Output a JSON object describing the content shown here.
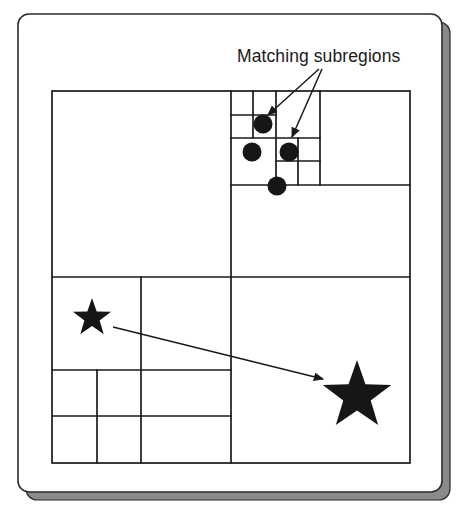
{
  "figure": {
    "title_annotation": "Matching subregions",
    "colors": {
      "background": "#ffffff",
      "line": "#1a1a1a",
      "shape_fill": "#161616",
      "frame_shadow": "#8a8a8a",
      "frame_border": "#2b2b2b",
      "text": "#1a1a1a"
    },
    "frame": {
      "outer_x": 18,
      "outer_y": 14,
      "outer_width": 424,
      "outer_height": 478,
      "corner_radius": 11,
      "shadow_offset": 8
    },
    "quadtree": {
      "x": 52,
      "y": 91,
      "width": 358,
      "height": 372,
      "name": "quadtree-root",
      "lines": [
        {
          "name": "root-vertical-mid",
          "x1": 231,
          "y1": 91,
          "x2": 231,
          "y2": 463
        },
        {
          "name": "root-horizontal-mid",
          "x1": 52,
          "y1": 277,
          "x2": 410,
          "y2": 277
        },
        {
          "name": "ne-horizontal-mid",
          "x1": 231,
          "y1": 185,
          "x2": 410,
          "y2": 185
        },
        {
          "name": "ne-vertical-mid",
          "x1": 320,
          "y1": 91,
          "x2": 320,
          "y2": 185
        },
        {
          "name": "ne-nw-horizontal",
          "x1": 231,
          "y1": 138,
          "x2": 320,
          "y2": 138
        },
        {
          "name": "ne-nw-vertical",
          "x1": 276,
          "y1": 91,
          "x2": 276,
          "y2": 185
        },
        {
          "name": "ne-nw-nw-horizontal",
          "x1": 231,
          "y1": 115,
          "x2": 276,
          "y2": 115
        },
        {
          "name": "ne-nw-nw-vertical",
          "x1": 253,
          "y1": 91,
          "x2": 253,
          "y2": 138
        },
        {
          "name": "ne-nw-sw-quad-h",
          "x1": 276,
          "y1": 161,
          "x2": 320,
          "y2": 161
        },
        {
          "name": "ne-nw-se-vertical",
          "x1": 298,
          "y1": 138,
          "x2": 298,
          "y2": 185
        },
        {
          "name": "sw-vertical-mid",
          "x1": 141,
          "y1": 277,
          "x2": 141,
          "y2": 463
        },
        {
          "name": "sw-horizontal-mid",
          "x1": 52,
          "y1": 370,
          "x2": 231,
          "y2": 370
        },
        {
          "name": "sw-sw-vertical",
          "x1": 97,
          "y1": 370,
          "x2": 97,
          "y2": 463
        },
        {
          "name": "sw-sw-horizontal",
          "x1": 52,
          "y1": 416,
          "x2": 141,
          "y2": 416
        },
        {
          "name": "sw-se-horizontal",
          "x1": 141,
          "y1": 416,
          "x2": 231,
          "y2": 416
        }
      ]
    },
    "dots": [
      {
        "name": "dot-1",
        "cx": 263,
        "cy": 124,
        "r": 9.5
      },
      {
        "name": "dot-2",
        "cx": 252,
        "cy": 152,
        "r": 9.5
      },
      {
        "name": "dot-3",
        "cx": 289,
        "cy": 152,
        "r": 9.5
      },
      {
        "name": "dot-4",
        "cx": 277,
        "cy": 186,
        "r": 9.5
      }
    ],
    "stars": [
      {
        "name": "star-small",
        "cx": 92,
        "cy": 318,
        "r": 20,
        "rotation": 0
      },
      {
        "name": "star-large",
        "cx": 357,
        "cy": 396,
        "r": 36,
        "rotation": 0
      }
    ],
    "annotation_label": {
      "text": "Matching subregions",
      "x": 237,
      "y": 62
    },
    "arrows": [
      {
        "name": "annotation-arrow-1",
        "x1": 319,
        "y1": 69,
        "x2": 268,
        "y2": 115
      },
      {
        "name": "annotation-arrow-2",
        "x1": 322,
        "y1": 69,
        "x2": 292,
        "y2": 137
      },
      {
        "name": "match-arrow-star",
        "x1": 113,
        "y1": 327,
        "x2": 323,
        "y2": 379
      }
    ]
  }
}
